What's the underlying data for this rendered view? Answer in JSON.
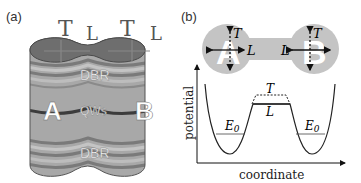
{
  "panel_a": {
    "label": "(a)",
    "mode_labels": [
      "T",
      "L",
      "T",
      "L"
    ],
    "top_layer": "DBR",
    "middle_layer": "QWs",
    "bottom_layer": "DBR",
    "pillar_left": "A",
    "pillar_right": "B",
    "colors": {
      "body": "#a8a8a8",
      "top_cap": "#6e6e6e",
      "stripe_dark": "#7a7a7a",
      "stripe_light": "#bdbdbd",
      "qw_line": "#3c3c3c"
    }
  },
  "panel_b": {
    "label": "(b)",
    "circle_left": "A",
    "circle_right": "B",
    "arrow_t": "T",
    "arrow_l": "L",
    "potential": {
      "ylabel": "potential",
      "xlabel": "coordinate",
      "level_left": "E",
      "level_left_sub": "0",
      "level_right": "E",
      "level_right_sub": "0",
      "barrier_top": "T",
      "barrier_bottom": "L"
    },
    "colors": {
      "circle_fill": "#c4c4c4",
      "line": "#222222"
    }
  }
}
